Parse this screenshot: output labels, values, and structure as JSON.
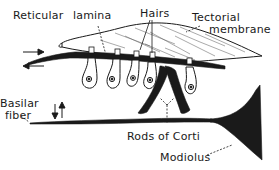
{
  "diagram": {
    "labels": {
      "reticular": "Reticular",
      "lamina": "lamina",
      "hairs": "Hairs",
      "tectorial_1": "Tectorial",
      "tectorial_2": "membrane",
      "basilar_1": "Basilar",
      "basilar_2": "fiber",
      "rods": "Rods of Corti",
      "modiolus": "Modiolus"
    },
    "colors": {
      "ink": "#1a1a1a",
      "background": "#ffffff"
    },
    "components": [
      "tectorial-membrane",
      "reticular-lamina",
      "hair-cells",
      "rods-of-corti",
      "basilar-fiber",
      "modiolus",
      "shear-arrows",
      "vibration-arrows"
    ]
  }
}
